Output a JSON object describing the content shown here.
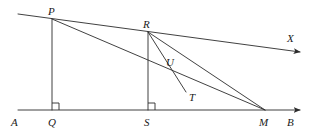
{
  "figure": {
    "kind": "geometry-diagram",
    "width": 313,
    "height": 133,
    "background_color": "#ffffff",
    "stroke_color": "#2b2b2b",
    "label_color": "#1a1a1a",
    "stroke_width": 0.9
  },
  "labels": {
    "A": "A",
    "B": "B",
    "P": "P",
    "Q": "Q",
    "R": "R",
    "S": "S",
    "M": "M",
    "T": "T",
    "U": "U",
    "X": "X"
  },
  "points": {
    "A": {
      "x": 18,
      "y": 110,
      "label": "A",
      "label_x": 11,
      "label_y": 117
    },
    "B": {
      "x": 300,
      "y": 110,
      "label": "B",
      "label_x": 287,
      "label_y": 117
    },
    "P": {
      "x": 52,
      "y": 19,
      "label": "P",
      "label_x": 48,
      "label_y": 6
    },
    "Q": {
      "x": 52,
      "y": 110,
      "label": "Q",
      "label_x": 48,
      "label_y": 117
    },
    "R": {
      "x": 148,
      "y": 32,
      "label": "R",
      "label_x": 143,
      "label_y": 19
    },
    "S": {
      "x": 148,
      "y": 110,
      "label": "S",
      "label_x": 144,
      "label_y": 117
    },
    "M": {
      "x": 265,
      "y": 110,
      "label": "M",
      "label_x": 259,
      "label_y": 117
    },
    "T": {
      "x": 186,
      "y": 92,
      "label": "T",
      "label_x": 189,
      "label_y": 92
    },
    "U": {
      "x": 170,
      "y": 70,
      "label": "U",
      "label_x": 166,
      "label_y": 57
    },
    "X": {
      "x": 300,
      "y": 52,
      "label": "X",
      "label_x": 287,
      "label_y": 33
    },
    "L": {
      "x": 18,
      "y": 14,
      "label": "",
      "label_x": 0,
      "label_y": 0
    }
  },
  "segments": [
    {
      "name": "base-line-AB",
      "from": "A",
      "to": "B",
      "arrow_end": true
    },
    {
      "name": "ray-L-through-P-R-to-X",
      "from": "L",
      "to": "X",
      "arrow_end": true
    },
    {
      "name": "perpendicular-PQ",
      "from": "P",
      "to": "Q",
      "arrow_end": false
    },
    {
      "name": "perpendicular-RS",
      "from": "R",
      "to": "S",
      "arrow_end": false
    },
    {
      "name": "cevian-P-to-M",
      "from": "P",
      "to": "M",
      "arrow_end": false
    },
    {
      "name": "cevian-R-to-M",
      "from": "R",
      "to": "M",
      "arrow_end": false
    },
    {
      "name": "segment-R-to-T",
      "from": "R",
      "to": "T",
      "arrow_end": false
    }
  ],
  "right_angles": [
    {
      "name": "right-angle-at-Q",
      "vertex": "Q",
      "size": 7
    },
    {
      "name": "right-angle-at-S",
      "vertex": "S",
      "size": 7
    }
  ]
}
